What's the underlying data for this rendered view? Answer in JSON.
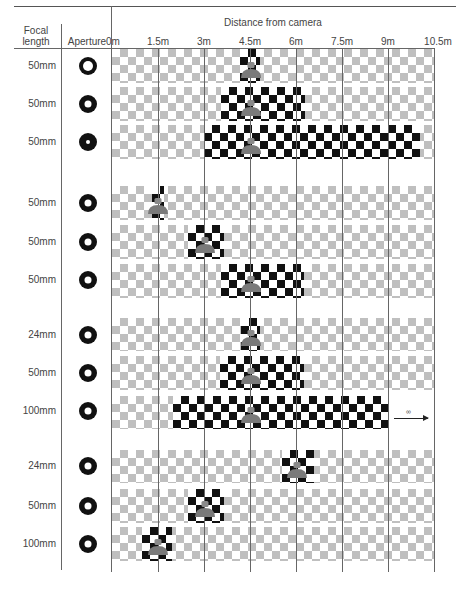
{
  "header": {
    "focal_length": "Focal\nlength",
    "focal_length_line1": "Focal",
    "focal_length_line2": "length",
    "aperture": "Aperture",
    "distance": "Distance from camera"
  },
  "axis": {
    "ticks": [
      "0m",
      "1.5m",
      "3m",
      "4.5m",
      "6m",
      "7.5m",
      "9m",
      "10.5m"
    ],
    "tick_values_m": [
      0,
      1.5,
      3,
      4.5,
      6,
      7.5,
      9,
      10.5
    ]
  },
  "colors": {
    "sharp_checker": "#111111",
    "blurred_checker": "#b9b9b9",
    "person": "#7a7a7a",
    "lines": "#666666"
  },
  "groups": [
    {
      "rows": [
        {
          "focal_length": "50mm",
          "aperture": "large-hole",
          "subject_m": 4.5,
          "focus_range_m": [
            4.1,
            4.8
          ]
        },
        {
          "focal_length": "50mm",
          "aperture": "medium-hole",
          "subject_m": 4.5,
          "focus_range_m": [
            3.6,
            6.1
          ]
        },
        {
          "focal_length": "50mm",
          "aperture": "small-hole",
          "subject_m": 4.5,
          "focus_range_m": [
            3.0,
            10.2
          ]
        }
      ]
    },
    {
      "rows": [
        {
          "focal_length": "50mm",
          "aperture": "medium-hole",
          "subject_m": 1.5,
          "focus_range_m": [
            1.3,
            1.7
          ]
        },
        {
          "focal_length": "50mm",
          "aperture": "medium-hole",
          "subject_m": 3.0,
          "focus_range_m": [
            2.6,
            3.6
          ]
        },
        {
          "focal_length": "50mm",
          "aperture": "medium-hole",
          "subject_m": 4.5,
          "focus_range_m": [
            3.6,
            6.1
          ]
        }
      ]
    },
    {
      "rows": [
        {
          "focal_length": "24mm",
          "aperture": "medium-hole",
          "subject_m": 4.5,
          "focus_range_m": [
            4.1,
            4.8
          ]
        },
        {
          "focal_length": "50mm",
          "aperture": "medium-hole",
          "subject_m": 4.5,
          "focus_range_m": [
            3.5,
            6.1
          ]
        },
        {
          "focal_length": "100mm",
          "aperture": "medium-hole",
          "subject_m": 4.5,
          "focus_range_m": [
            2.0,
            9.0
          ],
          "to_infinity": true,
          "infinity_label": "∞"
        }
      ]
    },
    {
      "rows": [
        {
          "focal_length": "24mm",
          "aperture": "medium-hole",
          "subject_m": 6.0,
          "focus_range_m": [
            5.6,
            6.6
          ]
        },
        {
          "focal_length": "50mm",
          "aperture": "medium-hole",
          "subject_m": 3.0,
          "focus_range_m": [
            2.6,
            3.6
          ]
        },
        {
          "focal_length": "100mm",
          "aperture": "medium-hole",
          "subject_m": 1.5,
          "focus_range_m": [
            1.0,
            2.0
          ]
        }
      ]
    }
  ],
  "labels": {
    "g0r0": "50mm",
    "g0r1": "50mm",
    "g0r2": "50mm",
    "g1r0": "50mm",
    "g1r1": "50mm",
    "g1r2": "50mm",
    "g2r0": "24mm",
    "g2r1": "50mm",
    "g2r2": "100mm",
    "g3r0": "24mm",
    "g3r1": "50mm",
    "g3r2": "100mm",
    "infinity": "∞"
  }
}
